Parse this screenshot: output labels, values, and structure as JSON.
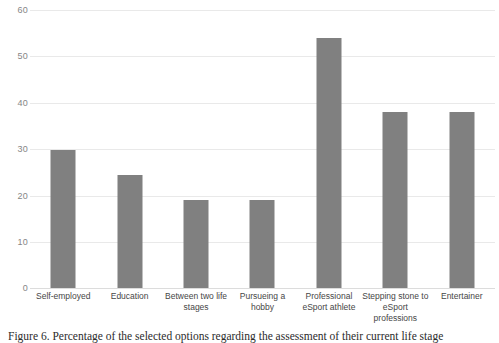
{
  "chart_data": {
    "type": "bar",
    "title": "",
    "subtitle": "",
    "xlabel": "",
    "ylabel": "",
    "ylim": [
      0,
      60
    ],
    "yticks": [
      0,
      10,
      20,
      30,
      40,
      50,
      60
    ],
    "grid": "horizontal",
    "legend": "none",
    "bar_color": "#808080",
    "gridline_color": "#e9e9e9",
    "categories": [
      "Self-employed",
      "Education",
      "Between two life stages",
      "Pursueing a hobby",
      "Professional eSport athlete",
      "Stepping stone to eSport professions",
      "Entertainer"
    ],
    "values": [
      29.7,
      24.4,
      19,
      19,
      54,
      38,
      38
    ]
  },
  "caption": {
    "text": "Figure 6. Percentage of the selected options regarding the assessment of their current life stage"
  }
}
